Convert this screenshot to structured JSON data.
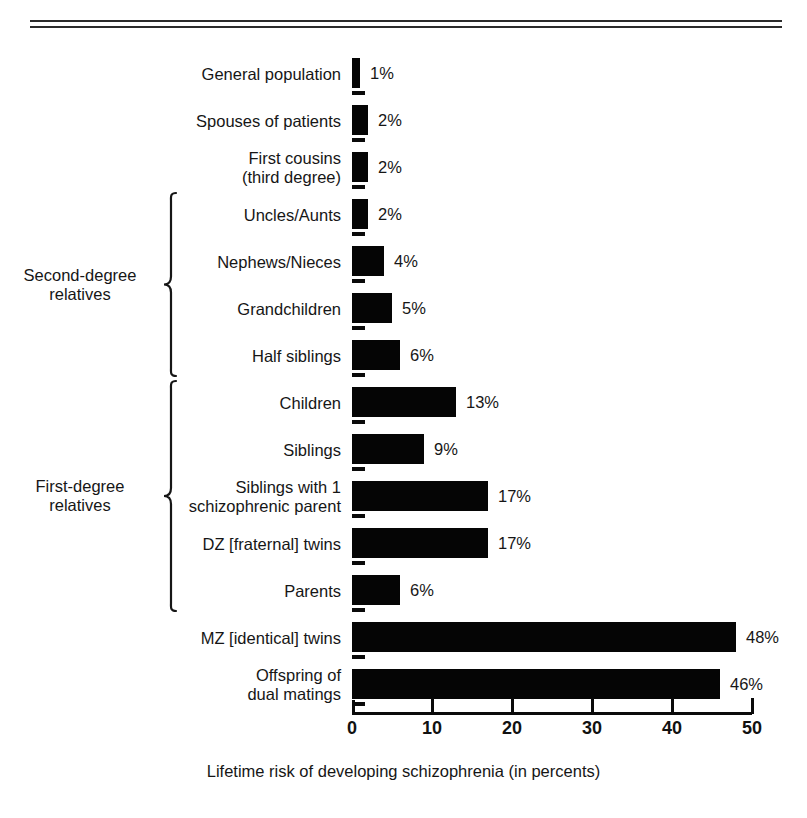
{
  "figure": {
    "caption": "Lifetime risk of developing schizophrenia (in percents)"
  },
  "chart_data": {
    "type": "bar",
    "orientation": "horizontal",
    "title": "",
    "xlabel": "Lifetime risk of developing schizophrenia (in percents)",
    "ylabel": "",
    "xlim": [
      0,
      50
    ],
    "xticks": [
      0,
      10,
      20,
      30,
      40,
      50
    ],
    "xtick_labels": [
      "0",
      "10",
      "20",
      "30",
      "40",
      "50"
    ],
    "grid": false,
    "legend": null,
    "bar_color": "#050505",
    "value_suffix": "%",
    "categories": [
      "General population",
      "Spouses of patients",
      "First cousins\n(third degree)",
      "Uncles/Aunts",
      "Nephews/Nieces",
      "Grandchildren",
      "Half siblings",
      "Children",
      "Siblings",
      "Siblings with 1\nschizophrenic parent",
      "DZ [fraternal] twins",
      "Parents",
      "MZ [identical] twins",
      "Offspring of\ndual matings"
    ],
    "values": [
      1,
      2,
      2,
      2,
      4,
      5,
      6,
      13,
      9,
      17,
      17,
      6,
      48,
      46
    ],
    "value_labels": [
      "1%",
      "2%",
      "2%",
      "2%",
      "4%",
      "5%",
      "6%",
      "13%",
      "9%",
      "17%",
      "17%",
      "6%",
      "48%",
      "46%"
    ],
    "groups": [
      {
        "label": "Second-degree\nrelatives",
        "first_index": 3,
        "last_index": 6
      },
      {
        "label": "First-degree\nrelatives",
        "first_index": 7,
        "last_index": 11
      }
    ]
  }
}
